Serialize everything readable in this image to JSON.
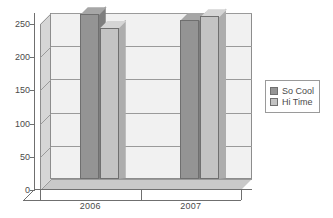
{
  "chart_data": {
    "type": "bar",
    "title": "",
    "subtitle": "",
    "xlabel": "",
    "ylabel": "",
    "categories": [
      "2006",
      "2007"
    ],
    "series": [
      {
        "name": "So Cool",
        "values": [
          248,
          240
        ],
        "color": "#949494"
      },
      {
        "name": "Hi Time",
        "values": [
          228,
          245
        ],
        "color": "#c3c3c3"
      }
    ],
    "ylim": [
      0,
      250
    ],
    "ytick_labels": [
      "0",
      "50",
      "100",
      "150",
      "200",
      "250"
    ],
    "ytick_values": [
      0,
      50,
      100,
      150,
      200,
      250
    ],
    "grid": true,
    "legend_position": "right",
    "style": "3d-column",
    "plot_background": "#f1f1f1",
    "axis_color": "#6f6f6f",
    "grid_color": "#9a9a9a",
    "text_color": "#4a4a4a",
    "floor_color": "#c9c9c9",
    "wall_color": "#d6d6d6"
  },
  "legend": {
    "items": [
      {
        "label": "So Cool",
        "swatch_color": "#949494"
      },
      {
        "label": "Hi Time",
        "swatch_color": "#c3c3c3"
      }
    ]
  },
  "axes": {
    "y_labels": [
      "250",
      "200",
      "150",
      "100",
      "50",
      "0"
    ],
    "x_labels": [
      "2006",
      "2007"
    ]
  }
}
